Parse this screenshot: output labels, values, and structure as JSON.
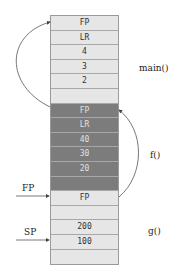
{
  "stack": {
    "cells": [
      {
        "text": "FP",
        "shade": "light"
      },
      {
        "text": "LR",
        "shade": "light"
      },
      {
        "text": "4",
        "shade": "light"
      },
      {
        "text": "3",
        "shade": "light"
      },
      {
        "text": "2",
        "shade": "light"
      },
      {
        "text": "",
        "shade": "light"
      },
      {
        "text": "FP",
        "shade": "dark"
      },
      {
        "text": "LR",
        "shade": "dark"
      },
      {
        "text": "40",
        "shade": "dark"
      },
      {
        "text": "30",
        "shade": "dark"
      },
      {
        "text": "20",
        "shade": "dark"
      },
      {
        "text": "",
        "shade": "dark"
      },
      {
        "text": "FP",
        "shade": "light"
      },
      {
        "text": "",
        "shade": "light"
      },
      {
        "text": "200",
        "shade": "light"
      },
      {
        "text": "100",
        "shade": "light"
      },
      {
        "text": "",
        "shade": "light"
      }
    ]
  },
  "frames": {
    "main": "main()",
    "f": "f()",
    "g": "g()"
  },
  "pointers": {
    "fp": "FP",
    "sp": "SP"
  }
}
